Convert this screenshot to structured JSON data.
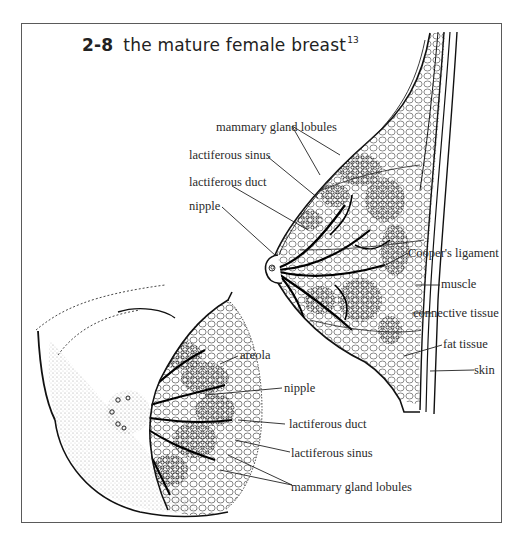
{
  "figure": {
    "number": "2-8",
    "title": "the mature female breast",
    "footnote_ref": "13"
  },
  "side_view": {
    "labels": [
      {
        "id": "mammary-gland-lobules",
        "text": "mammary gland lobules"
      },
      {
        "id": "lactiferous-sinus",
        "text": "lactiferous sinus"
      },
      {
        "id": "lactiferous-duct",
        "text": "lactiferous duct"
      },
      {
        "id": "nipple",
        "text": "nipple"
      },
      {
        "id": "coopers-ligament",
        "text": "Cooper's ligament"
      },
      {
        "id": "muscle",
        "text": "muscle"
      },
      {
        "id": "connective-tissue",
        "text": "connective tissue"
      },
      {
        "id": "fat-tissue",
        "text": "fat tissue"
      },
      {
        "id": "skin",
        "text": "skin"
      }
    ]
  },
  "front_view": {
    "labels": [
      {
        "id": "areola",
        "text": "areola"
      },
      {
        "id": "nipple",
        "text": "nipple"
      },
      {
        "id": "lactiferous-duct",
        "text": "lactiferous duct"
      },
      {
        "id": "lactiferous-sinus",
        "text": "lactiferous sinus"
      },
      {
        "id": "mammary-gland-lobules",
        "text": "mammary gland lobules"
      }
    ]
  },
  "colors": {
    "ink": "#1a1a1a",
    "frame": "#5a5a5a",
    "background": "#ffffff"
  }
}
